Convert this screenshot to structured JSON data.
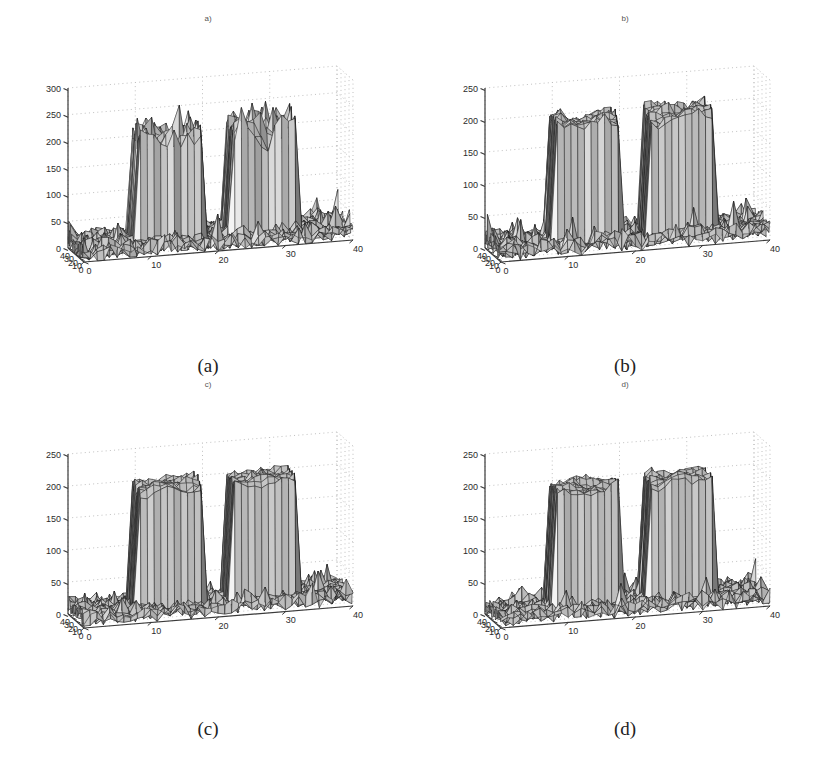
{
  "figure": {
    "width": 833,
    "height": 769,
    "background": "#ffffff",
    "layout": "2x2 grid of MATLAB-style 3D mesh surface plots",
    "colors": {
      "axis_line": "#3a3a3a",
      "grid_dot": "#b9b9b9",
      "mesh_edge": "#1a1a1a",
      "face_light": "#f2f2f2",
      "face_mid": "#c9c9c9",
      "face_dark": "#8f8f8f",
      "tick_label": "#2b2b2b",
      "title_text": "#555555",
      "caption_text": "#222222"
    }
  },
  "panels": [
    {
      "id": "panel-a",
      "title": "a)",
      "caption": "(a)",
      "zticks": [
        "0",
        "50",
        "100",
        "150",
        "200",
        "250",
        "300"
      ],
      "zvalues": [
        0,
        50,
        100,
        150,
        200,
        250,
        300
      ],
      "zlim": [
        0,
        300
      ],
      "yticks": [
        "0",
        "10",
        "20",
        "30",
        "40"
      ],
      "yvalues": [
        0,
        10,
        20,
        30,
        40
      ],
      "xticks": [
        "0",
        "10",
        "20",
        "30",
        "40"
      ],
      "xvalues": [
        0,
        10,
        20,
        30,
        40
      ],
      "xlim": [
        0,
        40
      ],
      "ylim": [
        0,
        40
      ],
      "noise_amplitude": 34,
      "plateau_height": 205,
      "plateau_roughness": 30,
      "floor_roughness": 20,
      "seed": 11
    },
    {
      "id": "panel-b",
      "title": "b)",
      "caption": "(b)",
      "zticks": [
        "0",
        "50",
        "100",
        "150",
        "200",
        "250"
      ],
      "zvalues": [
        0,
        50,
        100,
        150,
        200,
        250
      ],
      "zlim": [
        0,
        250
      ],
      "yticks": [
        "0",
        "10",
        "20",
        "30",
        "40"
      ],
      "yvalues": [
        0,
        10,
        20,
        30,
        40
      ],
      "xticks": [
        "0",
        "10",
        "20",
        "30",
        "40"
      ],
      "xvalues": [
        0,
        10,
        20,
        30,
        40
      ],
      "xlim": [
        0,
        40
      ],
      "ylim": [
        0,
        40
      ],
      "noise_amplitude": 20,
      "plateau_height": 200,
      "plateau_roughness": 14,
      "floor_roughness": 16,
      "seed": 23
    },
    {
      "id": "panel-c",
      "title": "c)",
      "caption": "(c)",
      "zticks": [
        "0",
        "50",
        "100",
        "150",
        "200",
        "250"
      ],
      "zvalues": [
        0,
        50,
        100,
        150,
        200,
        250
      ],
      "zlim": [
        0,
        250
      ],
      "yticks": [
        "0",
        "10",
        "20",
        "30",
        "40"
      ],
      "yvalues": [
        0,
        10,
        20,
        30,
        40
      ],
      "xticks": [
        "0",
        "10",
        "20",
        "30",
        "40"
      ],
      "xvalues": [
        0,
        10,
        20,
        30,
        40
      ],
      "xlim": [
        0,
        40
      ],
      "ylim": [
        0,
        40
      ],
      "noise_amplitude": 17,
      "plateau_height": 200,
      "plateau_roughness": 11,
      "floor_roughness": 14,
      "seed": 37
    },
    {
      "id": "panel-d",
      "title": "d)",
      "caption": "(d)",
      "zticks": [
        "0",
        "50",
        "100",
        "150",
        "200",
        "250"
      ],
      "zvalues": [
        0,
        50,
        100,
        150,
        200,
        250
      ],
      "zlim": [
        0,
        250
      ],
      "yticks": [
        "0",
        "10",
        "20",
        "30",
        "40"
      ],
      "yvalues": [
        0,
        10,
        20,
        30,
        40
      ],
      "xticks": [
        "0",
        "10",
        "20",
        "30",
        "40"
      ],
      "xvalues": [
        0,
        10,
        20,
        30,
        40
      ],
      "xlim": [
        0,
        40
      ],
      "ylim": [
        0,
        40
      ],
      "noise_amplitude": 17,
      "plateau_height": 200,
      "plateau_roughness": 12,
      "floor_roughness": 14,
      "seed": 53
    }
  ],
  "chart_data": {
    "type": "surface",
    "count": 4,
    "title": "",
    "shared": {
      "xlabel": "",
      "ylabel": "",
      "zlabel": "",
      "xticks": [
        0,
        10,
        20,
        30,
        40
      ],
      "yticks": [
        0,
        10,
        20,
        30,
        40
      ],
      "xlim": [
        0,
        40
      ],
      "ylim": [
        0,
        40
      ],
      "grid": true,
      "legend": null,
      "grid_size": 40,
      "view_azimuth": -37.5,
      "view_elevation": 30,
      "objects": [
        {
          "name": "plateau-left",
          "x_range": [
            9,
            18
          ],
          "y_range": [
            10,
            30
          ],
          "height": 200
        },
        {
          "name": "plateau-right",
          "x_range": [
            23,
            32
          ],
          "y_range": [
            10,
            30
          ],
          "height": 200
        }
      ],
      "background_level": 10
    },
    "panels": [
      {
        "label": "a)",
        "caption": "(a)",
        "zlim": [
          0,
          300
        ],
        "zticks": [
          0,
          50,
          100,
          150,
          200,
          250,
          300
        ],
        "plateau_height": 205,
        "peak_max": 275,
        "noise_sigma_plateau": 30,
        "noise_sigma_floor": 20,
        "note": "noisiest reconstruction; plateau tops heavily jagged, peaks exceed 250"
      },
      {
        "label": "b)",
        "caption": "(b)",
        "zlim": [
          0,
          250
        ],
        "zticks": [
          0,
          50,
          100,
          150,
          200,
          250
        ],
        "plateau_height": 200,
        "peak_max": 232,
        "noise_sigma_plateau": 14,
        "noise_sigma_floor": 16,
        "note": "partially denoised; plateau tops moderately rough"
      },
      {
        "label": "c)",
        "caption": "(c)",
        "zlim": [
          0,
          250
        ],
        "zticks": [
          0,
          50,
          100,
          150,
          200,
          250
        ],
        "plateau_height": 200,
        "peak_max": 228,
        "noise_sigma_plateau": 11,
        "noise_sigma_floor": 14,
        "note": "smoothest plateau tops, flat side walls"
      },
      {
        "label": "d)",
        "caption": "(d)",
        "zlim": [
          0,
          250
        ],
        "zticks": [
          0,
          50,
          100,
          150,
          200,
          250
        ],
        "plateau_height": 200,
        "peak_max": 228,
        "noise_sigma_plateau": 12,
        "noise_sigma_floor": 14,
        "note": "nearly identical to (c); slightly more residual ripple"
      }
    ]
  }
}
